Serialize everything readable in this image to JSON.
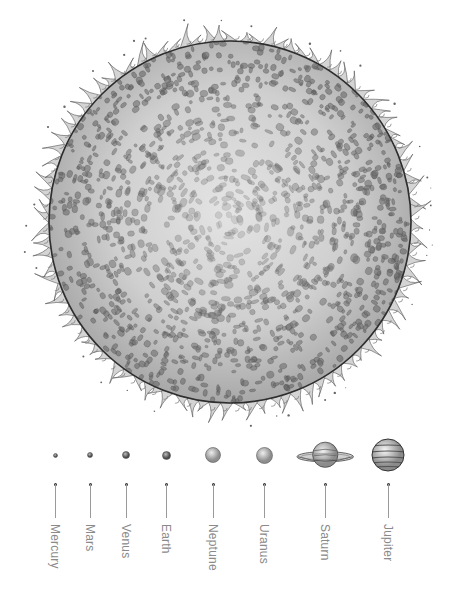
{
  "diagram": {
    "sun": {
      "name": "Sun",
      "center": [
        230,
        222
      ],
      "radius": 181,
      "colors": {
        "core": "#e4e4e4",
        "limb": "#a6a6a6",
        "outline": "#2e2e2e",
        "spots": "#6e6e6e"
      }
    },
    "planets": [
      {
        "name": "Mercury",
        "x": 55,
        "size": 5,
        "type": "rocky"
      },
      {
        "name": "Mars",
        "x": 90,
        "size": 6,
        "type": "rocky"
      },
      {
        "name": "Venus",
        "x": 126,
        "size": 8,
        "type": "rocky"
      },
      {
        "name": "Earth",
        "x": 166,
        "size": 9,
        "type": "rocky"
      },
      {
        "name": "Neptune",
        "x": 213,
        "size": 16,
        "type": "ice"
      },
      {
        "name": "Uranus",
        "x": 264,
        "size": 17,
        "type": "ice"
      },
      {
        "name": "Saturn",
        "x": 325,
        "size": 30,
        "type": "ringed"
      },
      {
        "name": "Jupiter",
        "x": 388,
        "size": 34,
        "type": "banded"
      }
    ],
    "planet_row_y": 455,
    "leader": {
      "dot_y": 484,
      "line_end_y": 518
    },
    "label_top_y": 524,
    "label_color": "#8a8a8a"
  }
}
